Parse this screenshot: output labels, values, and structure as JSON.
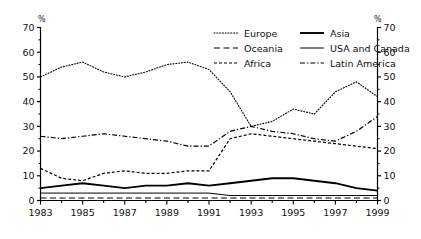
{
  "chart_data": {
    "type": "line",
    "title": "",
    "xlabel": "",
    "ylabel": "%",
    "ylabel_right": "%",
    "unit_symbol": "%",
    "grid": false,
    "legend_position": "top-right-inside",
    "xlim": [
      1983,
      1999
    ],
    "ylim": [
      0,
      70
    ],
    "yticks": [
      0,
      10,
      20,
      30,
      40,
      50,
      60,
      70
    ],
    "ytick_labels": [
      "0",
      "10",
      "20",
      "30",
      "40",
      "50",
      "60",
      "70"
    ],
    "yticks_right": [
      0,
      10,
      20,
      30,
      40,
      50,
      60,
      70
    ],
    "ytick_labels_right": [
      "0",
      "10",
      "20",
      "30",
      "40",
      "50",
      "60",
      "70"
    ],
    "x": [
      1983,
      1984,
      1985,
      1986,
      1987,
      1988,
      1989,
      1990,
      1991,
      1992,
      1993,
      1994,
      1995,
      1996,
      1997,
      1998,
      1999
    ],
    "xticks": [
      1983,
      1984,
      1985,
      1986,
      1987,
      1988,
      1989,
      1990,
      1991,
      1992,
      1993,
      1994,
      1995,
      1996,
      1997,
      1998,
      1999
    ],
    "xtick_labels_shown": [
      "1983",
      "1985",
      "1987",
      "1989",
      "1991",
      "1993",
      "1995",
      "1997",
      "1999"
    ],
    "series": [
      {
        "name": "Europe",
        "style": "dotted",
        "values": [
          50,
          54,
          56,
          52,
          50,
          52,
          55,
          56,
          53,
          44,
          30,
          32,
          37,
          35,
          44,
          48,
          42
        ]
      },
      {
        "name": "Asia",
        "style": "solid-thick",
        "values": [
          5,
          6,
          7,
          6,
          5,
          6,
          6,
          7,
          6,
          7,
          8,
          9,
          9,
          8,
          7,
          5,
          4
        ]
      },
      {
        "name": "Oceania",
        "style": "dashed-long",
        "values": [
          1,
          1,
          1,
          1,
          1,
          1,
          1,
          1,
          1,
          1,
          1,
          1,
          1,
          1,
          1,
          1,
          1
        ]
      },
      {
        "name": "USA and Canada",
        "style": "solid-thin",
        "values": [
          3,
          3,
          3,
          3,
          3,
          3,
          3,
          3,
          3,
          2,
          2,
          2,
          2,
          2,
          2,
          2,
          2
        ]
      },
      {
        "name": "Africa",
        "style": "dashed-short",
        "values": [
          13,
          9,
          8,
          11,
          12,
          11,
          11,
          12,
          12,
          25,
          27,
          26,
          25,
          24,
          23,
          22,
          21
        ]
      },
      {
        "name": "Latin America",
        "style": "dash-dot",
        "values": [
          26,
          25,
          26,
          27,
          26,
          25,
          24,
          22,
          22,
          28,
          30,
          28,
          27,
          25,
          24,
          28,
          34
        ]
      }
    ]
  },
  "legend": {
    "entries": [
      {
        "label": "Europe",
        "style": "dotted"
      },
      {
        "label": "Asia",
        "style": "solid-thick"
      },
      {
        "label": "Oceania",
        "style": "dashed-long"
      },
      {
        "label": "USA and Canada",
        "style": "solid-thin"
      },
      {
        "label": "Africa",
        "style": "dashed-short"
      },
      {
        "label": "Latin America",
        "style": "dash-dot"
      }
    ]
  },
  "colors": {
    "line": "#000000",
    "axis": "#000000",
    "text": "#111111",
    "background": "#ffffff"
  }
}
